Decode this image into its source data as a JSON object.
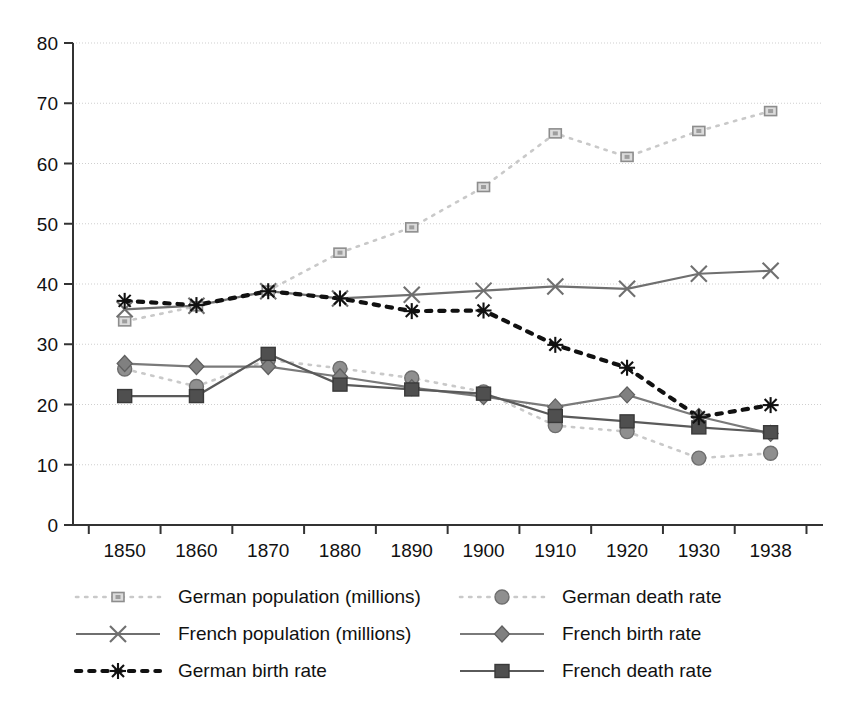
{
  "chart_data": {
    "type": "line",
    "title": "",
    "xlabel": "",
    "ylabel": "",
    "categories": [
      "1850",
      "1860",
      "1870",
      "1880",
      "1890",
      "1900",
      "1910",
      "1920",
      "1930",
      "1938"
    ],
    "x_tick_labels": [
      "1850",
      "1860",
      "1870",
      "1880",
      "1890",
      "1900",
      "1910",
      "1920",
      "1930",
      "1938"
    ],
    "y_tick_labels": [
      "0",
      "10",
      "20",
      "30",
      "40",
      "50",
      "60",
      "70",
      "80"
    ],
    "y_ticks": [
      0,
      10,
      20,
      30,
      40,
      50,
      60,
      70,
      80
    ],
    "ylim": [
      0,
      80
    ],
    "grid": "horizontal-dotted",
    "legend_position": "bottom",
    "legend_columns": 2,
    "series": [
      {
        "name": "German population (millions)",
        "marker": "square",
        "line_style": "dotted",
        "color": "#c9c9c9",
        "marker_color": "#9a9a9a",
        "values": [
          33.8,
          36.3,
          38.9,
          45.2,
          49.4,
          56.1,
          65.0,
          61.1,
          65.4,
          68.7
        ]
      },
      {
        "name": "German death rate",
        "marker": "circle",
        "line_style": "dotted",
        "color": "#c9c9c9",
        "marker_color": "#8a8a8a",
        "values": [
          25.9,
          23.0,
          27.4,
          26.0,
          24.4,
          22.1,
          16.5,
          15.5,
          11.1,
          11.9
        ]
      },
      {
        "name": "French population (millions)",
        "marker": "cross",
        "line_style": "solid",
        "color": "#6f6f6f",
        "marker_color": "#6f6f6f",
        "values": [
          35.8,
          36.4,
          38.8,
          37.6,
          38.2,
          38.9,
          39.6,
          39.2,
          41.7,
          42.2
        ]
      },
      {
        "name": "French birth rate",
        "marker": "diamond",
        "line_style": "solid",
        "color": "#7a7a7a",
        "marker_color": "#7a7a7a",
        "values": [
          26.8,
          26.3,
          26.3,
          24.6,
          22.8,
          21.3,
          19.6,
          21.6,
          18.0,
          15.2
        ]
      },
      {
        "name": "German birth rate",
        "marker": "asterisk",
        "line_style": "dashed",
        "color": "#111111",
        "marker_color": "#111111",
        "values": [
          37.2,
          36.5,
          38.8,
          37.6,
          35.5,
          35.6,
          29.9,
          26.1,
          17.9,
          19.9
        ]
      },
      {
        "name": "French death rate",
        "marker": "filled-square",
        "line_style": "solid",
        "color": "#5a5a5a",
        "marker_color": "#4a4a4a",
        "values": [
          21.4,
          21.4,
          28.4,
          23.3,
          22.5,
          21.8,
          18.1,
          17.2,
          16.2,
          15.4
        ]
      }
    ]
  },
  "legend": {
    "items": [
      {
        "label": "German population (millions)"
      },
      {
        "label": "German death rate"
      },
      {
        "label": "French population (millions)"
      },
      {
        "label": "French birth rate"
      },
      {
        "label": "German birth rate"
      },
      {
        "label": "French death rate"
      }
    ]
  },
  "axes": {
    "y_axis_name": "value-axis",
    "x_axis_name": "year-axis"
  }
}
